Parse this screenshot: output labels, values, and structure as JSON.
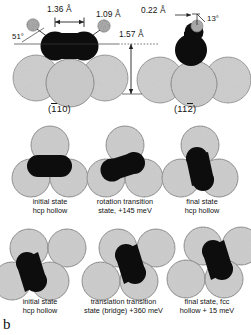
{
  "figure": {
    "panel_letter": "b",
    "top_row": {
      "left_panel": {
        "orientation": "(110)",
        "orientation_prefix": "(",
        "orientation_bar_digit": "1",
        "orientation_suffix": "10)",
        "labels": {
          "cc_distance": "1.36 Å",
          "ch_distance": "1.09 Å",
          "tilt_angle": "51°",
          "height": "1.57 Å"
        }
      },
      "right_panel": {
        "orientation": "(112)",
        "orientation_prefix": "(11",
        "orientation_bar_digit": "2",
        "orientation_suffix": ")",
        "labels": {
          "offset": "0.22 Å",
          "tilt_angle": "13°"
        }
      }
    },
    "middle_row": {
      "pathway": "rotation",
      "cells": [
        {
          "caption": "initial state\nhcp hollow",
          "site": "hcp hollow",
          "energy": ""
        },
        {
          "caption": "rotation transition\nstate, +145 meV",
          "site": "transition state",
          "energy": "+145 meV"
        },
        {
          "caption": "final state\nhcp hollow",
          "site": "hcp hollow",
          "energy": ""
        }
      ]
    },
    "bottom_row": {
      "pathway": "translation",
      "cells": [
        {
          "caption": "initial state\nhcp hollow",
          "site": "hcp hollow",
          "energy": ""
        },
        {
          "caption": "translation transition\nstate (bridge) +360 meV",
          "site": "bridge",
          "energy": "+360 meV"
        },
        {
          "caption": "final state, fcc\nhollow + 15 meV",
          "site": "fcc hollow",
          "energy": "+15 meV"
        }
      ]
    },
    "colors": {
      "substrate": "#cfcfcf",
      "substrate_outline": "#3a3a3a",
      "adsorbate_dark": "#111111",
      "hydrogen_gray": "#7a7a7a",
      "text": "#141414",
      "background": "#ffffff"
    }
  }
}
